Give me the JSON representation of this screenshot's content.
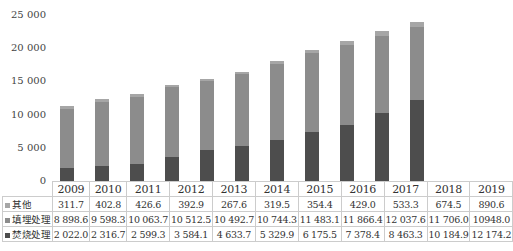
{
  "chart_data": {
    "type": "bar",
    "stacked": true,
    "title": "",
    "xlabel": "",
    "ylabel": "",
    "ylim": [
      0,
      25000
    ],
    "yticks": [
      "0",
      "5 000",
      "10 000",
      "15 000",
      "20 000",
      "25 000"
    ],
    "categories": [
      "2009",
      "2010",
      "2011",
      "2012",
      "2013",
      "2014",
      "2015",
      "2016",
      "2017",
      "2018",
      "2019"
    ],
    "series": [
      {
        "name": "焚烧处理",
        "color": "#4d4d4d",
        "values": [
          2022.0,
          2316.7,
          2599.3,
          3584.1,
          4633.7,
          5329.9,
          6175.5,
          7378.4,
          8463.3,
          10184.9,
          12174.2
        ],
        "labels": [
          "2 022.0",
          "2 316.7",
          "2 599.3",
          "3 584.1",
          "4 633.7",
          "5 329.9",
          "6 175.5",
          "7 378.4",
          "8 463.3",
          "10 184.9",
          "12 174.2"
        ]
      },
      {
        "name": "填埋处理",
        "color": "#8c8c8c",
        "values": [
          8898.6,
          9598.3,
          10063.7,
          10512.5,
          10492.7,
          10744.3,
          11483.1,
          11866.4,
          12037.6,
          11706.0,
          10948.0
        ],
        "labels": [
          "8 898.6",
          "9 598.3",
          "10 063.7",
          "10 512.5",
          "10 492.7",
          "10 744.3",
          "11 483.1",
          "11 866.4",
          "12 037.6",
          "11 706.0",
          "10948.0"
        ]
      },
      {
        "name": "其他",
        "color": "#a6a6a6",
        "values": [
          311.7,
          402.8,
          426.6,
          392.9,
          267.6,
          319.5,
          354.4,
          429.0,
          533.3,
          674.5,
          890.6
        ],
        "labels": [
          "311.7",
          "402.8",
          "426.6",
          "392.9",
          "267.6",
          "319.5",
          "354.4",
          "429.0",
          "533.3",
          "674.5",
          "890.6"
        ]
      }
    ],
    "data_table": true,
    "legend_position": "data-table-row-keys",
    "grid": false
  },
  "caption": "转载请注明"
}
